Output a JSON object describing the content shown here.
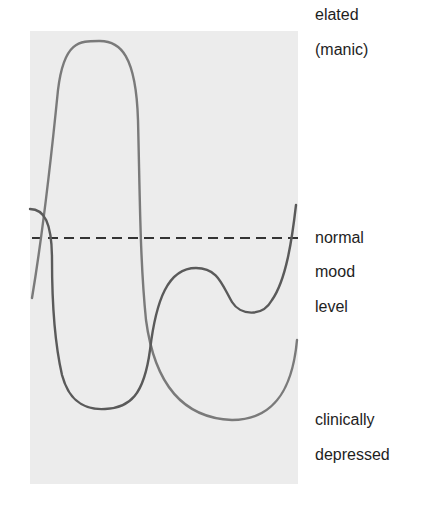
{
  "diagram": {
    "title": "",
    "labels": {
      "top_line1": "elated",
      "top_line2": "(manic)",
      "mid_line1": "normal",
      "mid_line2": "mood",
      "mid_line3": "level",
      "bottom_line1": "clinically",
      "bottom_line2": "depressed"
    },
    "colors": {
      "panel_background": "#ececec",
      "page_background": "#ffffff",
      "curve_light": "#7a7a7a",
      "curve_dark": "#5a5a5a",
      "baseline_dashed": "#333333",
      "text": "#1e1e1e"
    },
    "elements": [
      {
        "name": "shaded-panel",
        "type": "rectangle"
      },
      {
        "name": "normal-mood-baseline",
        "type": "dashed-line",
        "description": "horizontal dashed line at normal mood level"
      },
      {
        "name": "mood-curve-manic-then-depressed",
        "type": "curve",
        "description": "rises from below baseline to elated peak, then falls to deep depression and back up"
      },
      {
        "name": "mood-curve-depressed-then-mild",
        "type": "curve",
        "description": "starts near baseline, drops to depressed trough, recovers to mild dip below normal then rises above baseline"
      }
    ]
  }
}
